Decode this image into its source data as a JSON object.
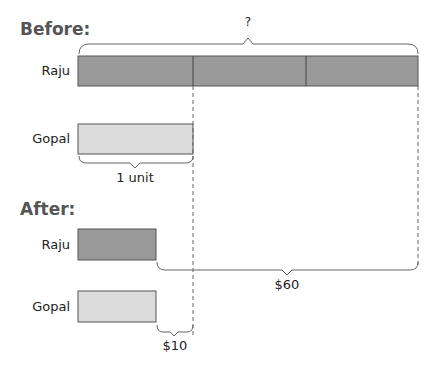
{
  "before": {
    "heading": "Before:",
    "raju": {
      "label": "Raju",
      "units": 3
    },
    "gopal": {
      "label": "Gopal",
      "units": 1
    },
    "total_label": "?",
    "unit_label": "1 unit"
  },
  "after": {
    "heading": "After:",
    "raju": {
      "label": "Raju"
    },
    "gopal": {
      "label": "Gopal"
    },
    "difference_raju_label": "$60",
    "difference_gopal_label": "$10"
  },
  "colors": {
    "raju_fill": "#999999",
    "gopal_fill": "#dddddd",
    "stroke": "#555555"
  }
}
